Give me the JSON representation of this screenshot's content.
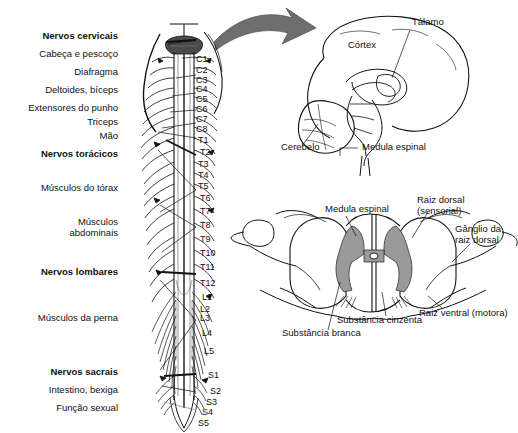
{
  "figure": {
    "background": "#ffffff",
    "ink": "#111111",
    "gray_matter_color": "#9a9a9a",
    "arrow_color": "#6e6e6e"
  },
  "panels": {
    "spinal_column": {
      "name": "Medula espinal e nervos espinhais (vista posterior)",
      "left_labels": [
        {
          "text": "Nervos cervicais",
          "bold": true,
          "x": 118,
          "y": 37
        },
        {
          "text": "Cabeça e pescoço",
          "bold": false,
          "x": 118,
          "y": 55
        },
        {
          "text": "Diafragma",
          "bold": false,
          "x": 118,
          "y": 73
        },
        {
          "text": "Deltoides, bíceps",
          "bold": false,
          "x": 118,
          "y": 91
        },
        {
          "text": "Extensores do punho",
          "bold": false,
          "x": 118,
          "y": 108
        },
        {
          "text": "Triceps",
          "bold": false,
          "x": 118,
          "y": 121
        },
        {
          "text": "Mão",
          "bold": false,
          "x": 118,
          "y": 136
        },
        {
          "text": "Nervos torácicos",
          "bold": true,
          "x": 118,
          "y": 153
        },
        {
          "text": "Músculos do tórax",
          "bold": false,
          "x": 118,
          "y": 188
        },
        {
          "text": "Músculos",
          "bold": false,
          "x": 118,
          "y": 222
        },
        {
          "text": "abdominais",
          "bold": false,
          "x": 118,
          "y": 232
        },
        {
          "text": "Nervos lombares",
          "bold": true,
          "x": 118,
          "y": 272
        },
        {
          "text": "Músculos da perna",
          "bold": false,
          "x": 118,
          "y": 318
        },
        {
          "text": "Nervos sacrais",
          "bold": true,
          "x": 118,
          "y": 372
        },
        {
          "text": "Intestino, bexiga",
          "bold": false,
          "x": 118,
          "y": 390
        },
        {
          "text": "Função sexual",
          "bold": false,
          "x": 118,
          "y": 408
        }
      ],
      "vertebral_levels": [
        {
          "text": "C1",
          "x": 196,
          "y": 60
        },
        {
          "text": "C2",
          "x": 196,
          "y": 71
        },
        {
          "text": "C3",
          "x": 196,
          "y": 81
        },
        {
          "text": "C4",
          "x": 196,
          "y": 90
        },
        {
          "text": "C5",
          "x": 196,
          "y": 99
        },
        {
          "text": "C6",
          "x": 196,
          "y": 110
        },
        {
          "text": "C7",
          "x": 196,
          "y": 120
        },
        {
          "text": "C8",
          "x": 196,
          "y": 130
        },
        {
          "text": "T1",
          "x": 198,
          "y": 140
        },
        {
          "text": "T2",
          "x": 200,
          "y": 152
        },
        {
          "text": "T3",
          "x": 198,
          "y": 165
        },
        {
          "text": "T4",
          "x": 198,
          "y": 175
        },
        {
          "text": "T5",
          "x": 198,
          "y": 186
        },
        {
          "text": "T6",
          "x": 200,
          "y": 198
        },
        {
          "text": "T7",
          "x": 200,
          "y": 211
        },
        {
          "text": "T8",
          "x": 200,
          "y": 226
        },
        {
          "text": "T9",
          "x": 200,
          "y": 240
        },
        {
          "text": "T10",
          "x": 200,
          "y": 253
        },
        {
          "text": "T11",
          "x": 200,
          "y": 267
        },
        {
          "text": "T12",
          "x": 200,
          "y": 283
        },
        {
          "text": "L1",
          "x": 202,
          "y": 297
        },
        {
          "text": "L2",
          "x": 200,
          "y": 309
        },
        {
          "text": "L3",
          "x": 200,
          "y": 318
        },
        {
          "text": "L4",
          "x": 202,
          "y": 333
        },
        {
          "text": "L5",
          "x": 204,
          "y": 351
        },
        {
          "text": "S1",
          "x": 208,
          "y": 375
        },
        {
          "text": "S2",
          "x": 210,
          "y": 391
        },
        {
          "text": "S3",
          "x": 206,
          "y": 402
        },
        {
          "text": "S4",
          "x": 202,
          "y": 412
        },
        {
          "text": "S5",
          "x": 198,
          "y": 423
        }
      ]
    },
    "brain": {
      "name": "Encéfalo em corte sagital",
      "labels": [
        {
          "text": "Tálamo",
          "x": 412,
          "y": 22,
          "align": "left"
        },
        {
          "text": "Córtex",
          "x": 348,
          "y": 45,
          "align": "left"
        },
        {
          "text": "Cerebelo",
          "x": 281,
          "y": 147,
          "align": "left"
        },
        {
          "text": "Medula espinal",
          "x": 362,
          "y": 147,
          "align": "left"
        }
      ]
    },
    "cord_cross_section": {
      "name": "Corte transversal da medula espinal",
      "labels": [
        {
          "text": "Medula espinal",
          "x": 325,
          "y": 209,
          "align": "left"
        },
        {
          "text": "Raiz dorsal",
          "x": 417,
          "y": 200,
          "align": "left"
        },
        {
          "text": "(sensorial)",
          "x": 417,
          "y": 211,
          "align": "left"
        },
        {
          "text": "Gânglio da",
          "x": 455,
          "y": 229,
          "align": "left"
        },
        {
          "text": "raiz dorsal",
          "x": 455,
          "y": 240,
          "align": "left"
        },
        {
          "text": "Raiz ventral (motora)",
          "x": 419,
          "y": 313,
          "align": "left"
        },
        {
          "text": "Substância cinzenta",
          "x": 337,
          "y": 320,
          "align": "left"
        },
        {
          "text": "Substância branca",
          "x": 282,
          "y": 333,
          "align": "left"
        }
      ]
    }
  }
}
